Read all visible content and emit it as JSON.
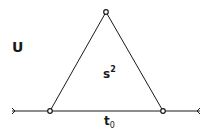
{
  "diagram": {
    "region_label": "U",
    "face_label": {
      "base": "s",
      "superscript": "2"
    },
    "edge_label": {
      "base": "t",
      "subscript": "0"
    },
    "vertices": [
      {
        "name": "top",
        "x": 106,
        "y": 12
      },
      {
        "name": "bottom-left",
        "x": 50,
        "y": 111
      },
      {
        "name": "bottom-right",
        "x": 163,
        "y": 111
      }
    ],
    "baseline": {
      "x1": 12,
      "x2": 200,
      "y": 111
    },
    "colors": {
      "stroke": "#1a1a1a",
      "background": "#ffffff"
    }
  }
}
